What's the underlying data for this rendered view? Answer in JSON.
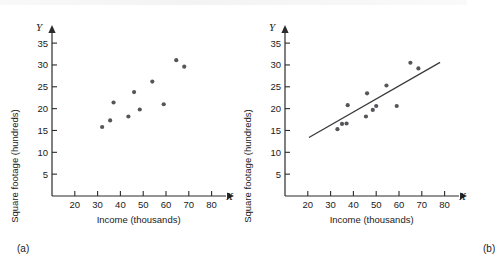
{
  "figure": {
    "panels": [
      {
        "id": "a",
        "caption": "(a)",
        "has_fit_line": false
      },
      {
        "id": "b",
        "caption": "(b)",
        "has_fit_line": true
      }
    ]
  },
  "chart_data": [
    {
      "type": "scatter",
      "title": "",
      "panel": "(a)",
      "xlabel": "Income (thousands)",
      "ylabel": "Square footage (hundreds)",
      "x_axis_name": "X",
      "y_axis_name": "Y",
      "xlim": [
        10,
        85
      ],
      "ylim": [
        0,
        38
      ],
      "xticks": [
        20,
        30,
        40,
        50,
        60,
        70,
        80
      ],
      "yticks": [
        5,
        10,
        15,
        20,
        25,
        30,
        35
      ],
      "xticklabels": [
        "20",
        "30",
        "40",
        "50",
        "60",
        "70",
        "80"
      ],
      "yticklabels": [
        "5",
        "10",
        "15",
        "20",
        "25",
        "30",
        "35"
      ],
      "grid": false,
      "legend": "none",
      "point_color": "#55565a",
      "x": [
        32.0,
        35.5,
        37.0,
        43.5,
        46.0,
        48.5,
        54.0,
        59.0,
        64.5,
        68.0
      ],
      "y": [
        15.8,
        17.3,
        21.4,
        18.2,
        23.8,
        19.8,
        26.2,
        21.0,
        31.1,
        29.6
      ],
      "points": [
        {
          "x": 32.0,
          "y": 15.8
        },
        {
          "x": 35.5,
          "y": 17.3
        },
        {
          "x": 37.0,
          "y": 21.4
        },
        {
          "x": 43.5,
          "y": 18.2
        },
        {
          "x": 46.0,
          "y": 23.8
        },
        {
          "x": 48.5,
          "y": 19.8
        },
        {
          "x": 54.0,
          "y": 26.2
        },
        {
          "x": 59.0,
          "y": 21.0
        },
        {
          "x": 64.5,
          "y": 31.1
        },
        {
          "x": 68.0,
          "y": 29.6
        }
      ]
    },
    {
      "type": "scatter",
      "title": "",
      "panel": "(b)",
      "xlabel": "Income (thousands)",
      "ylabel": "Square footage (hundreds)",
      "x_axis_name": "X",
      "y_axis_name": "Y",
      "xlim": [
        10,
        85
      ],
      "ylim": [
        0,
        38
      ],
      "xticks": [
        20,
        30,
        40,
        50,
        60,
        70,
        80
      ],
      "yticks": [
        5,
        10,
        15,
        20,
        25,
        30,
        35
      ],
      "xticklabels": [
        "20",
        "30",
        "40",
        "50",
        "60",
        "70",
        "80"
      ],
      "yticklabels": [
        "5",
        "10",
        "15",
        "20",
        "25",
        "30",
        "35"
      ],
      "grid": false,
      "legend": "none",
      "point_color": "#55565a",
      "line_color": "#3a3a3c",
      "x": [
        33.0,
        35.0,
        37.0,
        37.5,
        45.5,
        46.0,
        48.5,
        50.0,
        54.5,
        59.0,
        65.0,
        68.5
      ],
      "y": [
        15.3,
        16.5,
        16.6,
        20.8,
        18.2,
        23.5,
        19.7,
        20.6,
        25.3,
        20.6,
        30.5,
        29.2
      ],
      "points": [
        {
          "x": 33.0,
          "y": 15.3
        },
        {
          "x": 35.0,
          "y": 16.5
        },
        {
          "x": 37.0,
          "y": 16.6
        },
        {
          "x": 37.5,
          "y": 20.8
        },
        {
          "x": 45.5,
          "y": 18.2
        },
        {
          "x": 46.0,
          "y": 23.5
        },
        {
          "x": 48.5,
          "y": 19.7
        },
        {
          "x": 50.0,
          "y": 20.6
        },
        {
          "x": 54.5,
          "y": 25.3
        },
        {
          "x": 59.0,
          "y": 20.6
        },
        {
          "x": 65.0,
          "y": 30.5
        },
        {
          "x": 68.5,
          "y": 29.2
        }
      ],
      "fit_line": {
        "x0": 20.5,
        "y0": 13.4,
        "x1": 78.0,
        "y1": 30.6,
        "label": "least-squares regression line"
      }
    }
  ]
}
